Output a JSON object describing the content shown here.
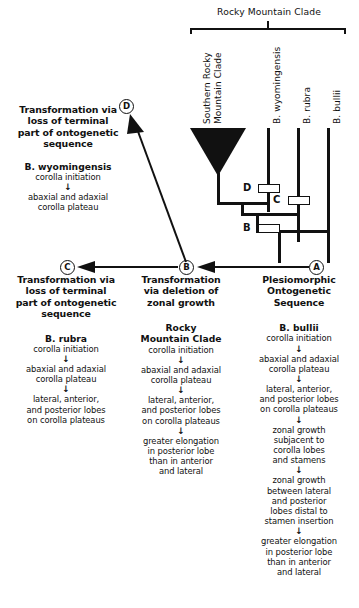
{
  "diagram": {
    "top_bracket_label": "Rocky Mountain Clade",
    "taxa": [
      {
        "id": "southern-rocky-mountain-clade",
        "label_line1": "Southern Rocky",
        "label_line2": "Mountain Clade"
      },
      {
        "id": "b-wyomingensis",
        "label_line1": "B. wyomingensis",
        "label_line2": ""
      },
      {
        "id": "b-rubra",
        "label_line1": "B. rubra",
        "label_line2": ""
      },
      {
        "id": "b-bullii",
        "label_line1": "B. bullii",
        "label_line2": ""
      }
    ],
    "nodes": [
      {
        "id": "node-d",
        "label": "D"
      },
      {
        "id": "node-c",
        "label": "C"
      },
      {
        "id": "node-b",
        "label": "B"
      }
    ],
    "circled": {
      "a": "A",
      "b": "B",
      "c": "C",
      "d": "D"
    }
  },
  "panel_d": {
    "heading": "Transformation via\nloss of terminal\npart of ontogenetic\nsequence",
    "heading_lines": [
      "Transformation via",
      "loss of terminal",
      "part of ontogenetic",
      "sequence"
    ],
    "taxon": "B. wyomingensis",
    "steps": [
      "corolla initiation",
      "abaxial and adaxial\ncorolla plateau"
    ],
    "step_lines": [
      [
        "corolla initiation"
      ],
      [
        "abaxial and adaxial",
        "corolla plateau"
      ]
    ],
    "arrow": "↓"
  },
  "panel_c": {
    "heading_lines": [
      "Transformation via",
      "loss of terminal",
      "part of ontogenetic",
      "sequence"
    ],
    "taxon": "B. rubra",
    "step_lines": [
      [
        "corolla initiation"
      ],
      [
        "abaxial and adaxial",
        "corolla plateau"
      ],
      [
        "lateral, anterior,",
        "and posterior lobes",
        "on corolla plateaus"
      ]
    ],
    "arrow": "↓"
  },
  "panel_b": {
    "heading_lines": [
      "Transformation",
      "via deletion of",
      "zonal growth"
    ],
    "taxon_lines": [
      "Rocky",
      "Mountain Clade"
    ],
    "step_lines": [
      [
        "corolla initiation"
      ],
      [
        "abaxial and adaxial",
        "corolla plateau"
      ],
      [
        "lateral, anterior,",
        "and posterior lobes",
        "on corolla plateaus"
      ],
      [
        "greater elongation",
        "in posterior lobe",
        "than in anterior",
        "and lateral"
      ]
    ],
    "arrow": "↓"
  },
  "panel_a": {
    "heading_lines": [
      "Plesiomorphic",
      "Ontogenetic",
      "Sequence"
    ],
    "taxon": "B. bullii",
    "step_lines": [
      [
        "corolla initiation"
      ],
      [
        "abaxial and adaxial",
        "corolla plateau"
      ],
      [
        "lateral, anterior,",
        "and posterior lobes",
        "on corolla plateaus"
      ],
      [
        "zonal growth",
        "subjacent to",
        "corolla lobes",
        "and stamens"
      ],
      [
        "zonal growth",
        "between lateral",
        "and posterior",
        "lobes distal to",
        "stamen insertion"
      ],
      [
        "greater elongation",
        "in posterior lobe",
        "than in anterior",
        "and lateral"
      ]
    ],
    "arrow": "↓"
  }
}
